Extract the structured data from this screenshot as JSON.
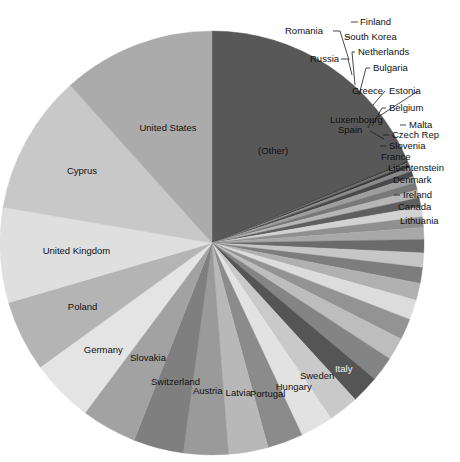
{
  "chart_data": {
    "type": "pie",
    "title": "",
    "subtitle": "",
    "xlabel": "",
    "ylabel": "",
    "legend_position": "none",
    "grid": false,
    "start_angle_deg": 0,
    "direction": "clockwise",
    "center": {
      "x": 212,
      "y": 243
    },
    "radius": 212,
    "categories": [
      "(Other)",
      "Finland",
      "South Korea",
      "Romania",
      "Russia",
      "Netherlands",
      "Bulgaria",
      "Greece",
      "Estonia",
      "Belgium",
      "Luxembourg",
      "Spain",
      "Malta",
      "Czech Rep",
      "Slovenia",
      "France",
      "Liechtenstein",
      "Denmark",
      "Ireland",
      "Canada",
      "Lithuania",
      "Italy",
      "Sweden",
      "Hungary",
      "Portugal",
      "Latvia",
      "Austria",
      "Switzerland",
      "Slovakia",
      "Germany",
      "Poland",
      "United Kingdom",
      "Cyprus",
      "United States"
    ],
    "values": [
      18.6,
      0.12,
      0.18,
      0.22,
      0.3,
      0.4,
      0.5,
      0.55,
      0.6,
      0.7,
      0.75,
      0.8,
      0.9,
      1.0,
      1.1,
      1.2,
      1.3,
      1.5,
      1.6,
      1.7,
      1.9,
      2.1,
      2.3,
      2.5,
      2.7,
      3.0,
      3.4,
      3.8,
      4.2,
      4.8,
      5.4,
      7.2,
      10.6,
      11.6
    ],
    "colors": [
      "#585858",
      "#2e2e2e",
      "#6f6f6f",
      "#3a3a3a",
      "#8a8a8a",
      "#4a4a4a",
      "#9e9e9e",
      "#787878",
      "#b6b6b6",
      "#5f5f5f",
      "#d2d2d2",
      "#8f8f8f",
      "#a8a8a8",
      "#6b6b6b",
      "#c6c6c6",
      "#7d7d7d",
      "#b0b0b0",
      "#dcdcdc",
      "#939393",
      "#bdbdbd",
      "#848484",
      "#555555",
      "#c9c9c9",
      "#e2e2e2",
      "#8b8b8b",
      "#b8b8b8",
      "#9a9a9a",
      "#7f7f7f",
      "#a2a2a2",
      "#e4e4e4",
      "#b4b4b4",
      "#dfdfdf",
      "#c8c8c8",
      "#ababab"
    ],
    "labels_inside": [
      "(Other)",
      "Italy",
      "Sweden",
      "Hungary",
      "Portugal",
      "Latvia",
      "Austria",
      "Switzerland",
      "Slovakia",
      "Germany",
      "Poland",
      "United Kingdom",
      "Cyprus",
      "United States"
    ],
    "labels_outside_with_leader": [
      "Finland",
      "South Korea",
      "Romania",
      "Russia",
      "Netherlands",
      "Bulgaria",
      "Greece",
      "Estonia",
      "Belgium",
      "Luxembourg",
      "Spain",
      "Malta",
      "Czech Rep",
      "Slovenia",
      "Ireland"
    ],
    "labels_outside_no_leader": [
      "France",
      "Liechtenstein",
      "Denmark",
      "Canada",
      "Lithuania"
    ]
  },
  "labels": {
    "other": "(Other)",
    "finland": "Finland",
    "south_korea": "South Korea",
    "romania": "Romania",
    "russia": "Russia",
    "netherlands": "Netherlands",
    "bulgaria": "Bulgaria",
    "greece": "Greece",
    "estonia": "Estonia",
    "belgium": "Belgium",
    "luxembourg": "Luxembourg",
    "spain": "Spain",
    "malta": "Malta",
    "czech_rep": "Czech Rep",
    "slovenia": "Slovenia",
    "france": "France",
    "liechtenstein": "Liechtenstein",
    "denmark": "Denmark",
    "ireland": "Ireland",
    "canada": "Canada",
    "lithuania": "Lithuania",
    "italy": "Italy",
    "sweden": "Sweden",
    "hungary": "Hungary",
    "portugal": "Portugal",
    "latvia": "Latvia",
    "austria": "Austria",
    "switzerland": "Switzerland",
    "slovakia": "Slovakia",
    "germany": "Germany",
    "poland": "Poland",
    "united_kingdom": "United Kingdom",
    "cyprus": "Cyprus",
    "united_states": "United States"
  }
}
